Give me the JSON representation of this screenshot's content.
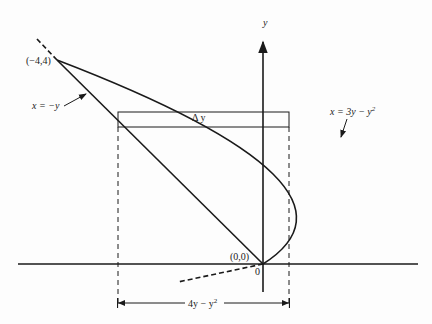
{
  "diagram": {
    "axes": {
      "x_label": "",
      "y_label": "y",
      "origin_label": "0"
    },
    "points": [
      {
        "label": "(−4,4)",
        "x": -4,
        "y": 4
      },
      {
        "label": "(0,0)",
        "x": 0,
        "y": 0
      }
    ],
    "curves": [
      {
        "label": "x = −y",
        "type": "line"
      },
      {
        "label": "x = 3y − y²",
        "type": "parabola"
      }
    ],
    "strip": {
      "label": "Δy"
    },
    "width_label": "4y − y²",
    "colors": {
      "ink": "#1a1a1a",
      "background": "#fdfdfd"
    }
  },
  "text": {
    "y_axis": "y",
    "origin": "0",
    "point_top": "(−4,4)",
    "point_origin": "(0,0)",
    "line_label": "x = −y",
    "parabola_label_main": "x = 3y − y",
    "parabola_label_exp": "2",
    "strip_label": "Δ y",
    "width_label_main": "4y − y",
    "width_label_exp": "2"
  }
}
